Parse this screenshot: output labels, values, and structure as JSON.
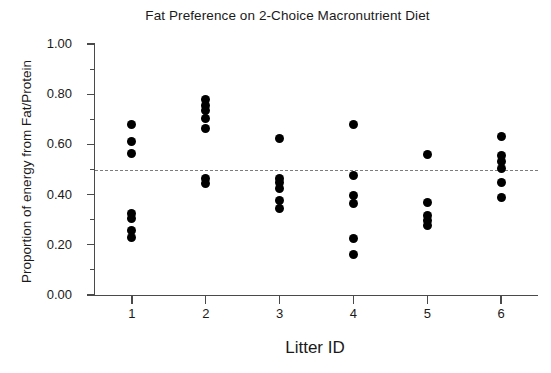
{
  "chart_data": {
    "type": "scatter",
    "title": "Fat Preference on 2-Choice Macronutrient Diet",
    "xlabel": "Litter ID",
    "ylabel": "Proportion of energy from Fat/Protein",
    "xlim": [
      0.5,
      6.5
    ],
    "ylim": [
      0.0,
      1.0
    ],
    "grid": false,
    "legend": null,
    "x_tick_labels": [
      "1",
      "2",
      "3",
      "4",
      "5",
      "6"
    ],
    "x_tick_values": [
      1,
      2,
      3,
      4,
      5,
      6
    ],
    "y_tick_labels": [
      "0.00",
      "0.20",
      "0.40",
      "0.60",
      "0.80",
      "1.00"
    ],
    "y_tick_values": [
      0.0,
      0.2,
      0.4,
      0.6,
      0.8,
      1.0
    ],
    "y_minor_tick_values": [
      0.1,
      0.3,
      0.5,
      0.7,
      0.9
    ],
    "reference_line": {
      "orientation": "horizontal",
      "value": 0.5,
      "style": "dashed",
      "color": "#7c7c7c"
    },
    "marker": {
      "shape": "circle",
      "color": "#000000",
      "size_px": 9
    },
    "series": [
      {
        "name": "Litter 1",
        "x": 1,
        "values": [
          0.68,
          0.61,
          0.565,
          0.325,
          0.305,
          0.255,
          0.23
        ]
      },
      {
        "name": "Litter 2",
        "x": 2,
        "values": [
          0.78,
          0.755,
          0.735,
          0.705,
          0.665,
          0.465,
          0.445
        ]
      },
      {
        "name": "Litter 3",
        "x": 3,
        "values": [
          0.625,
          0.465,
          0.45,
          0.425,
          0.375,
          0.345
        ]
      },
      {
        "name": "Litter 4",
        "x": 4,
        "values": [
          0.68,
          0.475,
          0.395,
          0.365,
          0.225,
          0.16
        ]
      },
      {
        "name": "Litter 5",
        "x": 5,
        "values": [
          0.56,
          0.37,
          0.315,
          0.295,
          0.275
        ]
      },
      {
        "name": "Litter 6",
        "x": 6,
        "values": [
          0.63,
          0.555,
          0.53,
          0.505,
          0.45,
          0.39
        ]
      }
    ]
  }
}
